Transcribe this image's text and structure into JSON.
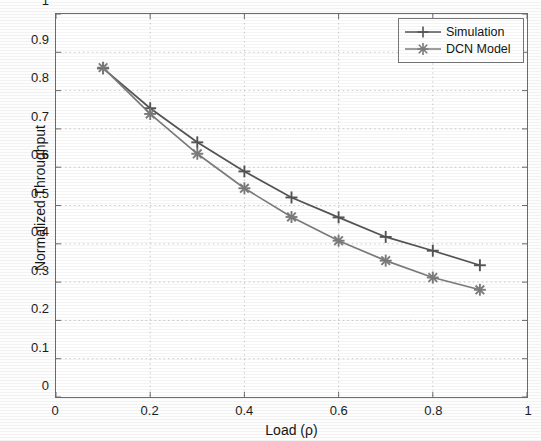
{
  "chart_data": {
    "type": "line",
    "title": "",
    "xlabel": "Load (ρ)",
    "ylabel": "Normalized Throughput",
    "xlim": [
      0,
      1
    ],
    "ylim": [
      0,
      1
    ],
    "xticks": [
      "0",
      "0.2",
      "0.4",
      "0.6",
      "0.8",
      "1"
    ],
    "xtick_values": [
      0,
      0.2,
      0.4,
      0.6,
      0.8,
      1
    ],
    "yticks": [
      "0",
      "0.1",
      "0.2",
      "0.3",
      "0.4",
      "0.5",
      "0.6",
      "0.7",
      "0.8",
      "0.9",
      "1"
    ],
    "ytick_values": [
      0,
      0.1,
      0.2,
      0.3,
      0.4,
      0.5,
      0.6,
      0.7,
      0.8,
      0.9,
      1
    ],
    "grid": true,
    "grid_style": "dotted",
    "legend_position": "top-right",
    "x": [
      0.1,
      0.2,
      0.3,
      0.4,
      0.5,
      0.6,
      0.7,
      0.8,
      0.9
    ],
    "series": [
      {
        "name": "Simulation",
        "marker": "plus",
        "color": "#545454",
        "values": [
          0.858,
          0.754,
          0.665,
          0.589,
          0.521,
          0.469,
          0.418,
          0.382,
          0.344
        ]
      },
      {
        "name": "DCN Model",
        "marker": "asterisk",
        "color": "#7c7c7c",
        "values": [
          0.86,
          0.739,
          0.635,
          0.545,
          0.47,
          0.408,
          0.356,
          0.312,
          0.28
        ]
      }
    ]
  },
  "legend": {
    "entries": [
      {
        "label": "Simulation",
        "marker": "plus-marker-icon"
      },
      {
        "label": "DCN Model",
        "marker": "asterisk-marker-icon"
      }
    ]
  },
  "axes": {
    "x_title": "Load (ρ)",
    "y_title": "Normalized Throughput"
  }
}
